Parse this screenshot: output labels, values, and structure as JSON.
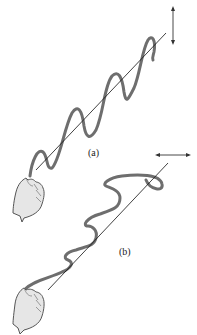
{
  "figure": {
    "type": "diagram",
    "panels": [
      {
        "id": "a",
        "label": "(a)",
        "polarization": "vertical",
        "arrow": "vertical double-headed arrow"
      },
      {
        "id": "b",
        "label": "(b)",
        "polarization": "horizontal",
        "arrow": "horizontal double-headed arrow"
      }
    ],
    "colors": {
      "rope": "#6e6e6e",
      "axis": "#111111",
      "hand_fill": "#e6e6e6",
      "hand_outline": "#555555"
    }
  }
}
